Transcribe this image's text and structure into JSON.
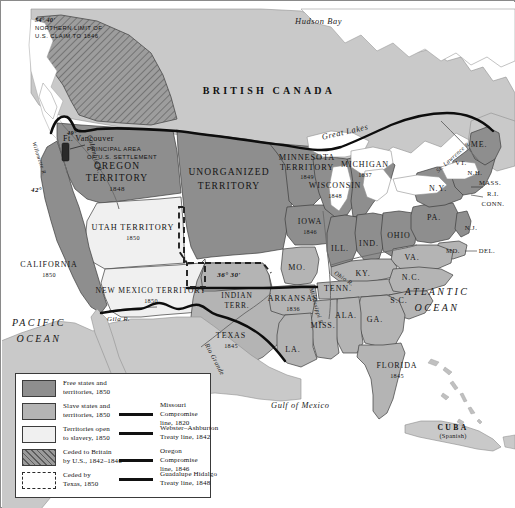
{
  "map": {
    "title": "The United States in 1850",
    "countries": [
      {
        "name": "british-canada",
        "label": "BRITISH CANADA"
      },
      {
        "name": "mexico",
        "label": "MEXICO"
      },
      {
        "name": "cuba",
        "label": "CUBA",
        "sub": "(Spanish)"
      }
    ],
    "oceans": [
      {
        "name": "pacific-ocean",
        "line1": "PACIFIC",
        "line2": "OCEAN"
      },
      {
        "name": "atlantic-ocean",
        "line1": "ATLANTIC",
        "line2": "OCEAN"
      }
    ],
    "water_features": [
      {
        "name": "hudson-bay",
        "label": "Hudson Bay"
      },
      {
        "name": "great-lakes",
        "label": "Great Lakes"
      },
      {
        "name": "gulf-of-mexico",
        "label": "Gulf of Mexico"
      },
      {
        "name": "columbia-river",
        "label": "Columbia R."
      },
      {
        "name": "willamette-river",
        "label": "Willamette R."
      },
      {
        "name": "st-lawrence-river",
        "label": "St. Lawrence R."
      },
      {
        "name": "mississippi-river",
        "label": "Mississippi R."
      },
      {
        "name": "ohio-river",
        "label": "Ohio R."
      },
      {
        "name": "rio-grande",
        "label": "Rio Grande"
      },
      {
        "name": "gila-river",
        "label": "Gila R."
      }
    ],
    "annotations": [
      {
        "name": "claim-limit-note",
        "line1": "54° 40'",
        "line2": "NORTHERN LIMIT OF",
        "line3": "U.S. CLAIM TO 1846"
      },
      {
        "name": "settlement-note",
        "line1": "PRINCIPAL AREA",
        "line2": "OF U.S. SETTLEMENT"
      },
      {
        "name": "fort-vancouver",
        "label": "Ft. Vancouver"
      },
      {
        "name": "latitude-42",
        "label": "42°"
      },
      {
        "name": "latitude-49",
        "label": "49°"
      },
      {
        "name": "latitude-36-30",
        "label": "36° 30'"
      }
    ],
    "territories": [
      {
        "name": "oregon-territory",
        "line1": "OREGON",
        "line2": "TERRITORY",
        "year": "1848"
      },
      {
        "name": "unorganized-territory",
        "line1": "UNORGANIZED",
        "line2": "TERRITORY",
        "year": ""
      },
      {
        "name": "minnesota-territory",
        "line1": "MINNESOTA",
        "line2": "TERRITORY",
        "year": "1849"
      },
      {
        "name": "utah-territory",
        "line1": "UTAH TERRITORY",
        "year": "1850"
      },
      {
        "name": "new-mexico-territory",
        "line1": "NEW MEXICO TERRITORY",
        "year": "1850"
      },
      {
        "name": "indian-territory",
        "line1": "INDIAN",
        "line2": "TERR.",
        "year": ""
      }
    ],
    "states": [
      {
        "name": "california",
        "label": "CALIFORNIA",
        "year": "1850"
      },
      {
        "name": "texas",
        "label": "TEXAS",
        "year": "1845"
      },
      {
        "name": "wisconsin",
        "label": "WISCONSIN",
        "year": "1848"
      },
      {
        "name": "iowa",
        "label": "IOWA",
        "year": "1846"
      },
      {
        "name": "michigan",
        "label": "MICHIGAN",
        "year": "1837"
      },
      {
        "name": "arkansas",
        "label": "ARKANSAS",
        "year": "1836"
      },
      {
        "name": "florida",
        "label": "FLORIDA",
        "year": "1845"
      },
      {
        "name": "missouri",
        "label": "MO.",
        "year": ""
      },
      {
        "name": "illinois",
        "label": "ILL.",
        "year": ""
      },
      {
        "name": "indiana",
        "label": "IND.",
        "year": ""
      },
      {
        "name": "ohio",
        "label": "OHIO",
        "year": ""
      },
      {
        "name": "kentucky",
        "label": "KY.",
        "year": ""
      },
      {
        "name": "tennessee",
        "label": "TENN.",
        "year": ""
      },
      {
        "name": "virginia",
        "label": "VA.",
        "year": ""
      },
      {
        "name": "north-carolina",
        "label": "N.C.",
        "year": ""
      },
      {
        "name": "south-carolina",
        "label": "S.C.",
        "year": ""
      },
      {
        "name": "georgia",
        "label": "GA.",
        "year": ""
      },
      {
        "name": "alabama",
        "label": "ALA.",
        "year": ""
      },
      {
        "name": "mississippi",
        "label": "MISS.",
        "year": ""
      },
      {
        "name": "louisiana",
        "label": "LA.",
        "year": ""
      },
      {
        "name": "pennsylvania",
        "label": "PA.",
        "year": ""
      },
      {
        "name": "new-york",
        "label": "N.Y.",
        "year": ""
      },
      {
        "name": "maine",
        "label": "ME.",
        "year": ""
      },
      {
        "name": "vermont",
        "label": "VT.",
        "year": ""
      },
      {
        "name": "new-hampshire",
        "label": "N.H.",
        "year": ""
      },
      {
        "name": "massachusetts",
        "label": "MASS.",
        "year": ""
      },
      {
        "name": "rhode-island",
        "label": "R.I.",
        "year": ""
      },
      {
        "name": "connecticut",
        "label": "CONN.",
        "year": ""
      },
      {
        "name": "new-jersey",
        "label": "N.J.",
        "year": ""
      },
      {
        "name": "maryland",
        "label": "MD.",
        "year": ""
      },
      {
        "name": "delaware",
        "label": "DEL.",
        "year": ""
      }
    ]
  },
  "legend": {
    "swatches": [
      {
        "name": "free-states",
        "line1": "Free states and",
        "line2": "territories, 1850",
        "color": "#8e8e8e"
      },
      {
        "name": "slave-states",
        "line1": "Slave states and",
        "line2": "territories, 1850",
        "color": "#b4b4b4"
      },
      {
        "name": "open-to-slavery",
        "line1": "Territories open",
        "line2": "to slavery, 1850",
        "color": "#f0f0f0"
      },
      {
        "name": "ceded-to-britain",
        "line1": "Ceded to Britain",
        "line2": "by U.S., 1842–1846",
        "color": "#9a9a9a"
      },
      {
        "name": "ceded-by-texas",
        "line1": "Ceded by",
        "line2": "Texas, 1850",
        "color": "#ffffff"
      }
    ],
    "lines": [
      {
        "name": "missouri-compromise",
        "line1": "Missouri Compromise",
        "line2": "line, 1820",
        "color": "#111111"
      },
      {
        "name": "webster-ashburton",
        "line1": "Webster–Ashburton",
        "line2": "Treaty line, 1842",
        "color": "#111111"
      },
      {
        "name": "oregon-compromise",
        "line1": "Oregon Compromise",
        "line2": "line, 1846",
        "color": "#111111"
      },
      {
        "name": "guadalupe-hidalgo",
        "line1": "Guadalupe Hidalgo",
        "line2": "Treaty line, 1848",
        "color": "#111111"
      }
    ]
  },
  "colors": {
    "free": "#8e8e8e",
    "slave": "#b4b4b4",
    "open": "#f0f0f0",
    "foreign": "#c9c9c9",
    "water": "#ffffff",
    "border": "#3c3c3c",
    "treaty_line": "#111111"
  }
}
